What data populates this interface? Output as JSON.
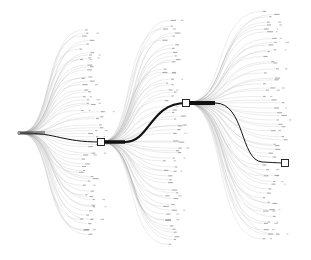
{
  "diagram": {
    "type": "hierarchical-flow-tree",
    "background": "#ffffff",
    "edge_color": "#9a9a9a",
    "main_path_color": "#111111",
    "root": {
      "x": 20,
      "y": 133
    },
    "nodes": [
      {
        "id": "n1",
        "x": 101,
        "y": 142,
        "shape": "square"
      },
      {
        "id": "n2",
        "x": 186,
        "y": 103,
        "shape": "square"
      },
      {
        "id": "n3",
        "x": 285,
        "y": 163,
        "shape": "square"
      }
    ],
    "fans": [
      {
        "from": [
          20,
          133
        ],
        "x_end": 92,
        "y_top": 30,
        "y_bottom": 235,
        "count": 60
      },
      {
        "from": [
          101,
          142
        ],
        "x_end": 175,
        "y_top": 22,
        "y_bottom": 245,
        "count": 60
      },
      {
        "from": [
          186,
          103
        ],
        "x_end": 275,
        "y_top": 10,
        "y_bottom": 240,
        "count": 60
      }
    ],
    "labels_note": "Leaf labels are rotated and too small to read"
  }
}
